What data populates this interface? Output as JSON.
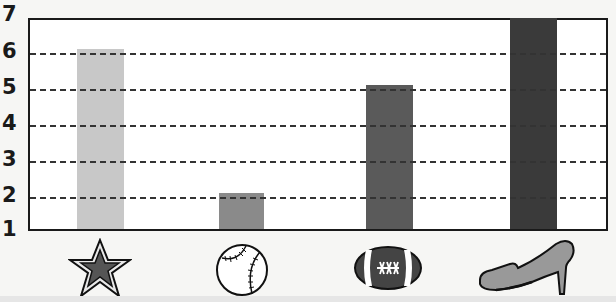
{
  "chart_data": {
    "type": "bar",
    "title": "",
    "xlabel": "",
    "ylabel": "",
    "ylim": [
      1,
      7
    ],
    "yticks": [
      "1",
      "2",
      "3",
      "4",
      "5",
      "6",
      "7"
    ],
    "grid": "dashed horizontal at 2-6",
    "categories": [
      "star",
      "baseball",
      "football",
      "shoe"
    ],
    "values": [
      6,
      2,
      5,
      7
    ],
    "colors": [
      "#c8c8c8",
      "#8a8a8a",
      "#5a5a5a",
      "#3a3a3a"
    ]
  }
}
